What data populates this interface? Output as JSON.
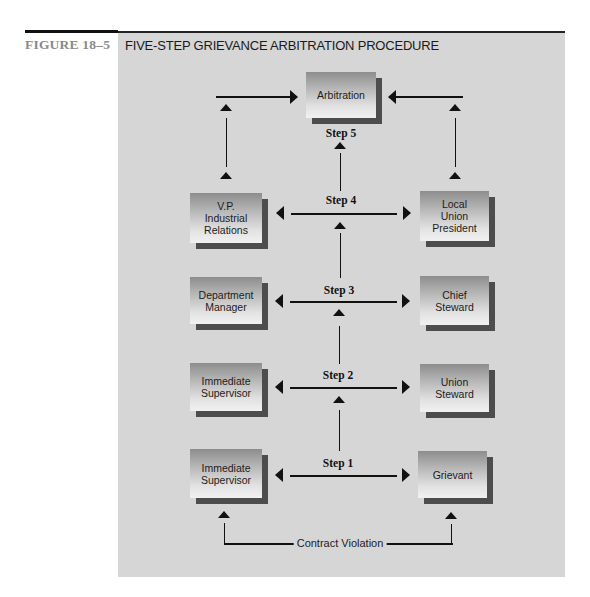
{
  "figure": {
    "label": "FIGURE 18–5",
    "title": "FIVE-STEP GRIEVANCE ARBITRATION PROCEDURE"
  },
  "nodes": {
    "arbitration": "Arbitration",
    "vp_industrial_relations": "V.P.\nIndustrial\nRelations",
    "local_union_president": "Local\nUnion\nPresident",
    "department_manager": "Department\nManager",
    "chief_steward": "Chief\nSteward",
    "immediate_supervisor_step2": "Immediate\nSupervisor",
    "union_steward": "Union\nSteward",
    "immediate_supervisor_step1": "Immediate\nSupervisor",
    "grievant": "Grievant"
  },
  "steps": [
    {
      "label": "Step 1",
      "left_node": "Immediate Supervisor",
      "right_node": "Grievant"
    },
    {
      "label": "Step 2",
      "left_node": "Immediate Supervisor",
      "right_node": "Union Steward"
    },
    {
      "label": "Step 3",
      "left_node": "Department Manager",
      "right_node": "Chief Steward"
    },
    {
      "label": "Step 4",
      "left_node": "V.P. Industrial Relations",
      "right_node": "Local Union President"
    },
    {
      "label": "Step 5",
      "left_node": "Arbitration",
      "right_node": "Arbitration"
    }
  ],
  "trigger": {
    "label": "Contract Violation"
  },
  "colors": {
    "panel_background": "#d6d6d6",
    "box_shadow": "#4d4d4d",
    "line": "#111111",
    "figure_label": "#8a8a8a"
  }
}
